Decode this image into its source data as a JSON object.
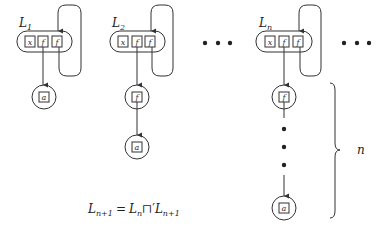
{
  "lists": [
    {
      "label": "L",
      "subscript": "1",
      "cells": [
        "x",
        "f",
        "f"
      ],
      "chain": [
        "a"
      ]
    },
    {
      "label": "L",
      "subscript": "2",
      "cells": [
        "x",
        "f",
        "f"
      ],
      "chain": [
        "f",
        "a"
      ]
    },
    {
      "label": "L",
      "subscript": "n",
      "cells": [
        "x",
        "f",
        "f"
      ],
      "chain": [
        "f",
        "...",
        "a"
      ]
    }
  ],
  "ellipsis": "• • •",
  "brace_label": "n",
  "equation": {
    "lhs": "L",
    "lhs_sub": "n+1",
    "eq": "=",
    "r1": "L",
    "r1_sub": "n",
    "op": "⊓′",
    "r2": "L",
    "r2_sub": "n+1"
  }
}
